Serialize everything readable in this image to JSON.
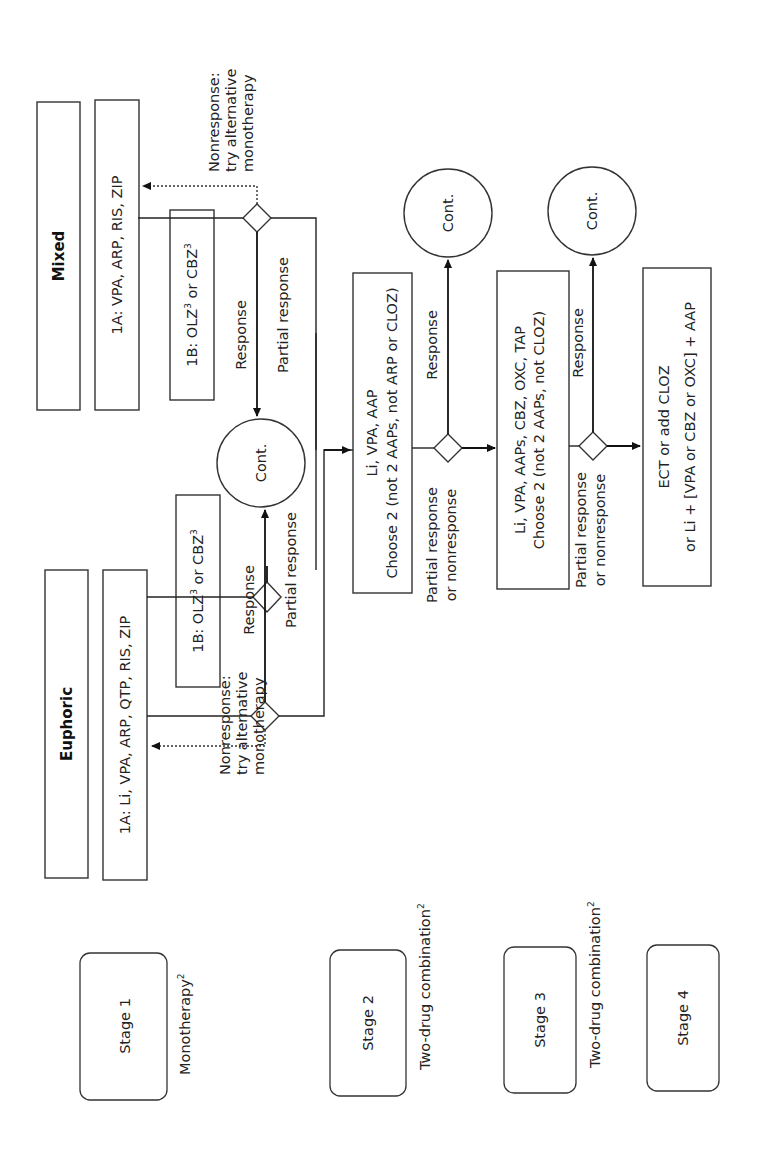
{
  "diagram": {
    "orientation": "rotated 90 degrees counter-clockwise",
    "stages": [
      {
        "label": "Stage 1",
        "description": "Monotherapy",
        "sup": "2"
      },
      {
        "label": "Stage 2",
        "description": "Two-drug combination",
        "sup": "2"
      },
      {
        "label": "Stage 3",
        "description": "Two-drug combination",
        "sup": "2"
      },
      {
        "label": "Stage 4",
        "description": "",
        "sup": ""
      }
    ],
    "columns": {
      "euphoric": {
        "header": "Euphoric",
        "option_1a": "1A: Li, VPA, ARP, QTP, RIS, ZIP",
        "option_1b_prefix": "1B: OLZ",
        "option_1b_mid": " or CBZ",
        "sup": "3",
        "nonresponse_lines": [
          "Nonresponse:",
          "try alternative",
          "monotherapy"
        ]
      },
      "mixed": {
        "header": "Mixed",
        "option_1a": "1A: VPA, ARP, RIS, ZIP",
        "option_1b_prefix": "1B: OLZ",
        "option_1b_mid": " or CBZ",
        "sup": "3",
        "nonresponse_lines": [
          "Nonresponse:",
          "try alternative",
          "monotherapy"
        ]
      }
    },
    "edge_labels": {
      "response": "Response",
      "partial_response": "Partial response",
      "partial_or_non": [
        "Partial response",
        "or nonresponse"
      ]
    },
    "continue_label": "Cont.",
    "stage2_box": [
      "Li, VPA, AAP",
      "Choose 2 (not 2 AAPs, not ARP or CLOZ)"
    ],
    "stage3_box": [
      "Li, VPA, AAPs, CBZ, OXC, TAP",
      "Choose 2 (not 2 AAPs, not CLOZ)"
    ],
    "stage4_box": [
      "ECT or add CLOZ",
      "or Li + [VPA or CBZ or OXC] + AAP"
    ]
  }
}
